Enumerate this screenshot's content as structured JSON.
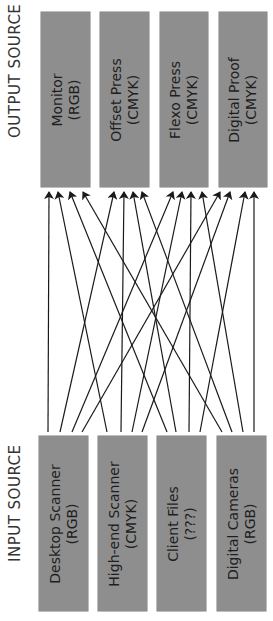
{
  "output_label": "OUTPUT SOURCE",
  "input_label": "INPUT SOURCE",
  "outputs": [
    {
      "name": "Monitor",
      "space": "(RGB)"
    },
    {
      "name": "Offset Press",
      "space": "(CMYK)"
    },
    {
      "name": "Flexo Press",
      "space": "(CMYK)"
    },
    {
      "name": "Digital Proof",
      "space": "(CMYK)"
    }
  ],
  "inputs": [
    {
      "name": "Desktop Scanner",
      "space": "(RGB)"
    },
    {
      "name": "High-end Scanner",
      "space": "(CMYK)"
    },
    {
      "name": "Client Files",
      "space": "(???)"
    },
    {
      "name": "Digital Cameras",
      "space": "(RGB)"
    }
  ],
  "connections": [
    {
      "from": 0,
      "to": 0
    },
    {
      "from": 0,
      "to": 1
    },
    {
      "from": 0,
      "to": 2
    },
    {
      "from": 0,
      "to": 3
    },
    {
      "from": 1,
      "to": 0
    },
    {
      "from": 1,
      "to": 1
    },
    {
      "from": 1,
      "to": 2
    },
    {
      "from": 1,
      "to": 3
    },
    {
      "from": 2,
      "to": 0
    },
    {
      "from": 2,
      "to": 1
    },
    {
      "from": 2,
      "to": 2
    },
    {
      "from": 2,
      "to": 3
    },
    {
      "from": 3,
      "to": 0
    },
    {
      "from": 3,
      "to": 1
    },
    {
      "from": 3,
      "to": 2
    },
    {
      "from": 3,
      "to": 3
    }
  ],
  "colors": {
    "box": "#8e8e8e",
    "line": "#1a1a1a",
    "text": "#1e1e1e"
  }
}
